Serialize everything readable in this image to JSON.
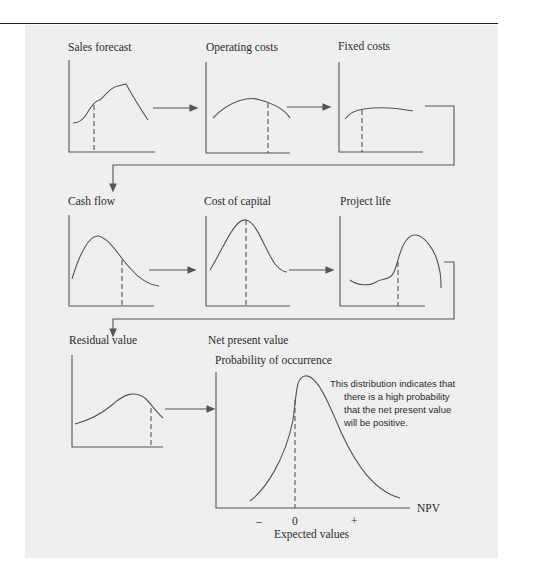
{
  "diagram": {
    "type": "simulation-flow",
    "colors": {
      "background": "#efefef",
      "line": "#555555",
      "text": "#2a2a2a"
    },
    "inputs": [
      {
        "label": "Sales forecast"
      },
      {
        "label": "Operating costs"
      },
      {
        "label": "Fixed costs"
      },
      {
        "label": "Cash flow"
      },
      {
        "label": "Cost of capital"
      },
      {
        "label": "Project life"
      },
      {
        "label": "Residual value"
      }
    ],
    "output": {
      "title": "Net present value",
      "y_label": "Probability of occurrence",
      "x_label": "NPV",
      "ticks": [
        "–",
        "0",
        "+"
      ],
      "x_caption": "Expected values",
      "annotation": [
        "This distribution indicates that",
        "there is a high probability",
        "that the net present value",
        "will be positive."
      ]
    }
  }
}
